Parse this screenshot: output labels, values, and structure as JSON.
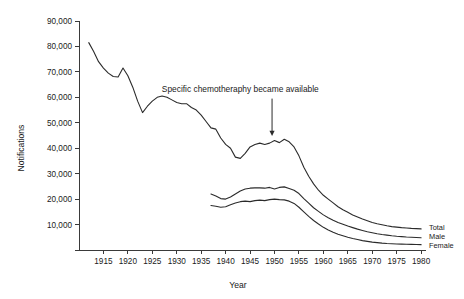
{
  "chart_data": {
    "type": "line",
    "title": "",
    "xlabel": "Year",
    "ylabel": "Notifications",
    "xlim": [
      1910,
      1981
    ],
    "ylim": [
      0,
      90000
    ],
    "grid": false,
    "legend_position": "right-inline-end-of-line",
    "y_ticks": [
      10000,
      20000,
      30000,
      40000,
      50000,
      60000,
      70000,
      80000,
      90000
    ],
    "y_tick_labels": [
      "10,000",
      "20,000",
      "30,000",
      "40,000",
      "50,000",
      "60,000",
      "70,000",
      "80,000",
      "90,000"
    ],
    "x_ticks": [
      1915,
      1920,
      1925,
      1930,
      1935,
      1940,
      1945,
      1950,
      1955,
      1960,
      1965,
      1970,
      1975,
      1980
    ],
    "x_tick_labels": [
      "1915",
      "1920",
      "1925",
      "1930",
      "1935",
      "1940",
      "1945",
      "1950",
      "1955",
      "1960",
      "1965",
      "1970",
      "1975",
      "1980"
    ],
    "annotations": [
      {
        "text": "Specific chemotheraphy became available",
        "text_x": 1943.0,
        "text_y": 62000,
        "arrow_from_x": 1949.5,
        "arrow_from_y": 59500,
        "arrow_to_x": 1949.5,
        "arrow_to_y": 44800
      }
    ],
    "series": [
      {
        "name": "Total",
        "label": "Total",
        "x": [
          1912,
          1913,
          1914,
          1915,
          1916,
          1917,
          1918,
          1919,
          1920,
          1921,
          1922,
          1923,
          1924,
          1925,
          1926,
          1927,
          1928,
          1929,
          1930,
          1931,
          1932,
          1933,
          1934,
          1935,
          1936,
          1937,
          1938,
          1939,
          1940,
          1941,
          1942,
          1943,
          1944,
          1945,
          1946,
          1947,
          1948,
          1949,
          1950,
          1951,
          1952,
          1953,
          1954,
          1955,
          1956,
          1957,
          1958,
          1959,
          1960,
          1961,
          1962,
          1963,
          1964,
          1965,
          1966,
          1967,
          1968,
          1969,
          1970,
          1971,
          1972,
          1973,
          1974,
          1975,
          1976,
          1977,
          1978,
          1979,
          1980
        ],
        "y": [
          81500,
          78000,
          74000,
          71500,
          69500,
          68200,
          68000,
          71500,
          68500,
          64000,
          58500,
          54000,
          56500,
          58500,
          60000,
          60500,
          60000,
          59000,
          58000,
          57500,
          57500,
          56000,
          55000,
          53000,
          50500,
          48000,
          47500,
          44000,
          41500,
          40000,
          36500,
          36000,
          38000,
          40500,
          41500,
          42000,
          41500,
          42000,
          43000,
          42200,
          43500,
          42500,
          40500,
          37000,
          32500,
          29000,
          26000,
          23500,
          21500,
          20000,
          18500,
          17000,
          15800,
          14800,
          13800,
          13000,
          12200,
          11500,
          10800,
          10300,
          9900,
          9500,
          9200,
          9000,
          8800,
          8650,
          8500,
          8400,
          8300
        ]
      },
      {
        "name": "Male",
        "label": "Male",
        "x": [
          1937,
          1938,
          1939,
          1940,
          1941,
          1942,
          1943,
          1944,
          1945,
          1946,
          1947,
          1948,
          1949,
          1950,
          1951,
          1952,
          1953,
          1954,
          1955,
          1956,
          1957,
          1958,
          1959,
          1960,
          1961,
          1962,
          1963,
          1964,
          1965,
          1966,
          1967,
          1968,
          1969,
          1970,
          1971,
          1972,
          1973,
          1974,
          1975,
          1976,
          1977,
          1978,
          1979,
          1980
        ],
        "y": [
          22000,
          21200,
          20200,
          20000,
          20800,
          22000,
          23200,
          24000,
          24300,
          24400,
          24400,
          24300,
          24600,
          24000,
          24600,
          24800,
          24200,
          23500,
          22200,
          20200,
          18400,
          16600,
          15200,
          13800,
          12700,
          11700,
          10800,
          10100,
          9400,
          8800,
          8200,
          7700,
          7200,
          6800,
          6400,
          6100,
          5850,
          5600,
          5400,
          5250,
          5100,
          5000,
          4900,
          4800
        ]
      },
      {
        "name": "Female",
        "label": "Female",
        "x": [
          1937,
          1938,
          1939,
          1940,
          1941,
          1942,
          1943,
          1944,
          1945,
          1946,
          1947,
          1948,
          1949,
          1950,
          1951,
          1952,
          1953,
          1954,
          1955,
          1956,
          1957,
          1958,
          1959,
          1960,
          1961,
          1962,
          1963,
          1964,
          1965,
          1966,
          1967,
          1968,
          1969,
          1970,
          1971,
          1972,
          1973,
          1974,
          1975,
          1976,
          1977,
          1978,
          1979,
          1980
        ],
        "y": [
          17500,
          17200,
          16800,
          17000,
          17800,
          18500,
          19000,
          19200,
          19000,
          19400,
          19600,
          19400,
          19800,
          20000,
          19800,
          19700,
          19200,
          18300,
          16800,
          15000,
          13200,
          11600,
          10200,
          8900,
          7900,
          7000,
          6200,
          5600,
          5000,
          4500,
          4100,
          3700,
          3400,
          3100,
          2900,
          2700,
          2550,
          2450,
          2350,
          2300,
          2250,
          2200,
          2150,
          2100
        ]
      }
    ]
  }
}
